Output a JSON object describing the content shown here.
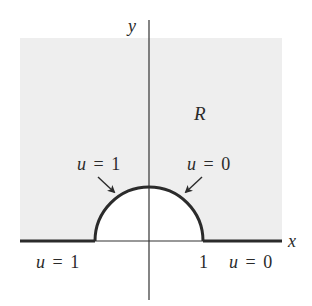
{
  "figure": {
    "region_label": "R",
    "axes": {
      "x_label": "x",
      "y_label": "y"
    },
    "tick_labels": {
      "x_one": "1"
    },
    "boundary_conditions": {
      "arc_left": {
        "var": "u",
        "eq": "=",
        "value": "1"
      },
      "arc_right": {
        "var": "u",
        "eq": "=",
        "value": "0"
      },
      "axis_left": {
        "var": "u",
        "eq": "=",
        "value": "1"
      },
      "axis_right": {
        "var": "u",
        "eq": "=",
        "value": "0"
      }
    },
    "colors": {
      "region_fill": "#eeeeee",
      "hole_fill": "#ffffff",
      "boundary_stroke": "#2b2b2b",
      "axis_stroke": "#333333"
    }
  }
}
